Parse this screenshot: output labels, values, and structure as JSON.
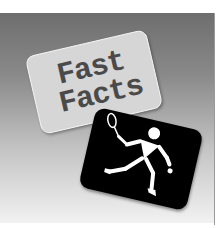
{
  "illustration": {
    "card_text_line1": "Fast",
    "card_text_line2": "Facts",
    "pictogram": "tennis-player-icon",
    "colors": {
      "panel_top": "#6e6e6e",
      "panel_bottom": "#f2f2f2",
      "fact_card": "#d6d6d6",
      "fact_text": "#4a4a4a",
      "sport_card": "#000000",
      "pictogram": "#ffffff"
    }
  }
}
